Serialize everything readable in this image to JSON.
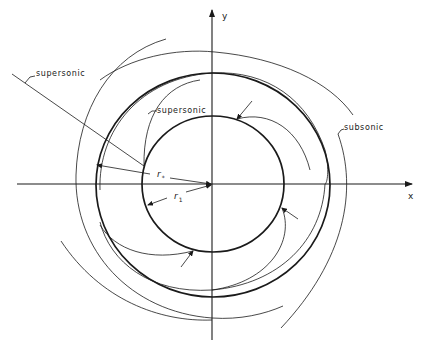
{
  "figure": {
    "type": "diagram",
    "axes": {
      "x_label": "x",
      "y_label": "y"
    },
    "radii": {
      "r_star_label": "r",
      "r_star_sub": "*",
      "r1_label": "r",
      "r1_sub": "1"
    },
    "annotations": {
      "outer_supersonic": "supersonic",
      "inner_supersonic": "supersonic",
      "subsonic": "subsonic"
    },
    "colors": {
      "line": "#1a1a1a",
      "background": "#ffffff"
    }
  }
}
